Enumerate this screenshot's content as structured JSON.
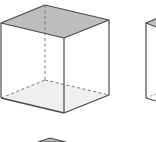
{
  "diagram": {
    "type": "cube-figures",
    "colors": {
      "background": "#ffffff",
      "edge": "#4a4a4a",
      "hidden_edge": "#6a6a6a",
      "top_face_fill": "#bdbdbd",
      "bottom_face_fill": "#efefef"
    },
    "cubes": [
      {
        "id": "cube-1",
        "shaded_faces": [
          "top",
          "bottom"
        ],
        "vertices": {
          "top_back": [
            45,
            5
          ],
          "top_left": [
            1,
            23
          ],
          "top_front": [
            64,
            38
          ],
          "top_right": [
            109,
            20
          ],
          "bottom_back": [
            45,
            80
          ],
          "bottom_left": [
            1,
            98
          ],
          "bottom_front": [
            64,
            113
          ],
          "bottom_right": [
            109,
            95
          ]
        }
      },
      {
        "id": "cube-2-partial",
        "shaded_faces": [
          "top"
        ],
        "visible_left_edge_x": 146
      },
      {
        "id": "cube-3-partial",
        "shaded_faces": [
          "top"
        ],
        "visible_apex": [
          50,
          138
        ]
      }
    ]
  }
}
